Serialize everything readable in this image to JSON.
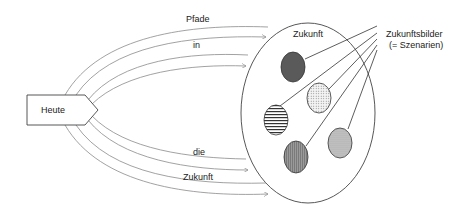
{
  "diagram": {
    "start_label": "Heute",
    "container_label": "Zukunft",
    "path_labels": [
      "Pfade",
      "in",
      "die",
      "Zukunft"
    ],
    "legend": {
      "line1": "Zukunftsbilder",
      "line2": "(= Szenarien)"
    },
    "scenarios": [
      {
        "name": "scenario-dark",
        "pattern": "solid-dark"
      },
      {
        "name": "scenario-dotted-light",
        "pattern": "dotted-light"
      },
      {
        "name": "scenario-horizontal-stripes",
        "pattern": "horizontal-stripes"
      },
      {
        "name": "scenario-vertical-stripes",
        "pattern": "vertical-stripes"
      },
      {
        "name": "scenario-dotted-gray",
        "pattern": "dotted-gray"
      }
    ],
    "colors": {
      "line": "#444444",
      "path_line": "#888888",
      "dark_fill": "#555555",
      "gray_fill": "#999999",
      "light_fill": "#dddddd"
    }
  }
}
